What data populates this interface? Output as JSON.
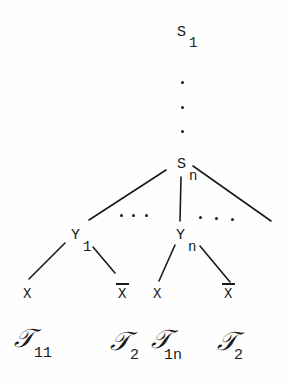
{
  "diagram": {
    "root": {
      "symbol": "S",
      "subscript": "1"
    },
    "vertical_ellipsis": "⋮",
    "node_sn": {
      "symbol": "S",
      "subscript": "n"
    },
    "children_ellipsis": [
      "…",
      "…"
    ],
    "node_y1": {
      "symbol": "Y",
      "subscript": "1"
    },
    "node_yn": {
      "symbol": "Y",
      "subscript": "n"
    },
    "leaves": [
      {
        "label": "X",
        "negated": false
      },
      {
        "label": "X",
        "negated": true
      },
      {
        "label": "X",
        "negated": false
      },
      {
        "label": "X",
        "negated": true
      }
    ],
    "leaf_annotations": [
      {
        "symbol": "𝒯",
        "subscript": "11"
      },
      {
        "symbol": "𝒯",
        "subscript": "2"
      },
      {
        "symbol": "𝒯",
        "subscript": "1n"
      },
      {
        "symbol": "𝒯",
        "subscript": "2"
      }
    ]
  }
}
